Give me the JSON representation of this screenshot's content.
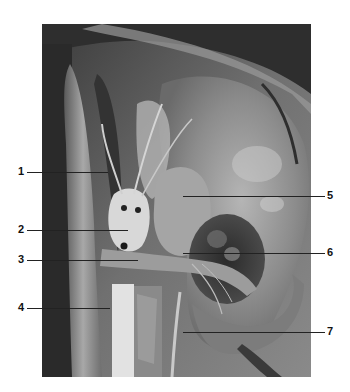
{
  "figure": {
    "type": "anatomical dissection photograph (grayscale)",
    "labels": [
      {
        "number": "1",
        "side": "left",
        "y": 172,
        "line_from": 27,
        "line_to": 108
      },
      {
        "number": "2",
        "side": "left",
        "y": 230,
        "line_from": 27,
        "line_to": 128
      },
      {
        "number": "3",
        "side": "left",
        "y": 260,
        "line_from": 27,
        "line_to": 138
      },
      {
        "number": "4",
        "side": "left",
        "y": 308,
        "line_from": 27,
        "line_to": 110
      },
      {
        "number": "5",
        "side": "right",
        "y": 196,
        "line_from": 183,
        "line_to": 325
      },
      {
        "number": "6",
        "side": "right",
        "y": 253,
        "line_from": 183,
        "line_to": 325
      },
      {
        "number": "7",
        "side": "right",
        "y": 332,
        "line_from": 183,
        "line_to": 325
      }
    ]
  },
  "colors": {
    "background": "#ffffff",
    "label_text": "#111111",
    "leader_line": "#222222"
  }
}
